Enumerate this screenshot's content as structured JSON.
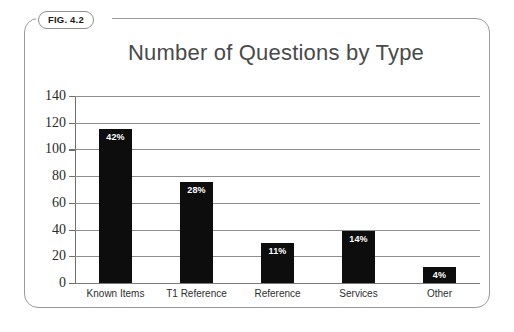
{
  "figure": {
    "tab_label": "FIG. 4.2"
  },
  "chart_data": {
    "type": "bar",
    "title": "Number of Questions by Type",
    "xlabel": "",
    "ylabel": "",
    "categories": [
      "Known Items",
      "T1 Reference",
      "Reference",
      "Services",
      "Other"
    ],
    "values": [
      115,
      76,
      30,
      39,
      12
    ],
    "data_labels": [
      "42%",
      "28%",
      "11%",
      "14%",
      "4%"
    ],
    "ylim": [
      0,
      140
    ],
    "yticks": [
      0,
      20,
      40,
      60,
      80,
      100,
      120,
      140
    ],
    "ytick_labels": [
      "0",
      "20",
      "40",
      "60",
      "80",
      "100",
      "120",
      "140"
    ],
    "grid": true,
    "legend": false,
    "bar_color": "#0d0d0d",
    "grid_color": "#8e8e8e",
    "title_color": "#4a4a4a",
    "data_label_color": "#ffffff"
  }
}
